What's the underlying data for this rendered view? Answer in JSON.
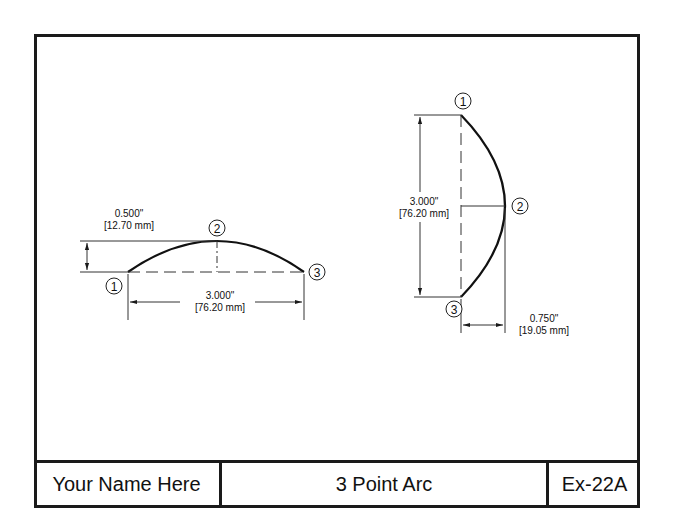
{
  "title_block": {
    "name": "Your Name Here",
    "title": "3 Point Arc",
    "number": "Ex-22A"
  },
  "left_arc": {
    "points": [
      "1",
      "2",
      "3"
    ],
    "height_dim": {
      "inch": "0.500\"",
      "mm": "[12.70 mm]"
    },
    "chord_dim": {
      "inch": "3.000\"",
      "mm": "[76.20 mm]"
    }
  },
  "right_arc": {
    "points": [
      "1",
      "2",
      "3"
    ],
    "chord_dim": {
      "inch": "3.000\"",
      "mm": "[76.20 mm]"
    },
    "depth_dim": {
      "inch": "0.750\"",
      "mm": "[19.05 mm]"
    }
  },
  "colors": {
    "line": "#1a1a1a",
    "background": "#ffffff"
  }
}
